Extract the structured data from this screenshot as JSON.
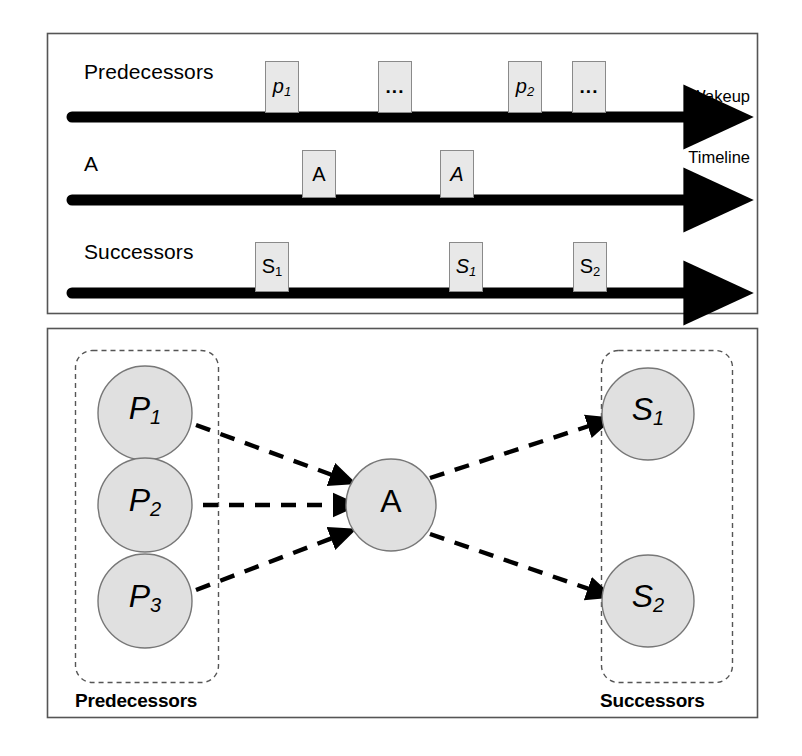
{
  "figure": {
    "title_text": "",
    "background": "#ffffff",
    "node_fill": "#e0e0e0",
    "node_stroke": "#777777",
    "box_fill": "#e8e8e8",
    "box_stroke": "#8a8a8a",
    "line_color": "#000000",
    "panel_stroke": "#555555",
    "dashed_stroke": "#555555"
  },
  "timeline_panel": {
    "axis_note": {
      "line1": "Wakeup",
      "line2": "Timeline"
    },
    "rows": [
      {
        "label": "Predecessors",
        "events": [
          {
            "text": "p",
            "sub": "1",
            "kind": "italic"
          },
          {
            "text": "...",
            "sub": "",
            "kind": "dots"
          },
          {
            "text": "p",
            "sub": "2",
            "kind": "italic"
          },
          {
            "text": "...",
            "sub": "",
            "kind": "dots"
          }
        ]
      },
      {
        "label": "A",
        "events": [
          {
            "text": "A",
            "sub": "",
            "kind": "upright"
          },
          {
            "text": "A",
            "sub": "",
            "kind": "italic"
          }
        ]
      },
      {
        "label": "Successors",
        "events": [
          {
            "text": "S",
            "sub": "1",
            "kind": "upright"
          },
          {
            "text": "S",
            "sub": "1",
            "kind": "italic"
          },
          {
            "text": "S",
            "sub": "2",
            "kind": "upright"
          }
        ]
      }
    ]
  },
  "graph_panel": {
    "groups": [
      {
        "caption": "Predecessors"
      },
      {
        "caption": "Successors"
      }
    ],
    "nodes": [
      {
        "id": "P1",
        "letter": "P",
        "sub": "1"
      },
      {
        "id": "P2",
        "letter": "P",
        "sub": "2"
      },
      {
        "id": "P3",
        "letter": "P",
        "sub": "3"
      },
      {
        "id": "A",
        "letter": "A",
        "sub": ""
      },
      {
        "id": "S1",
        "letter": "S",
        "sub": "1"
      },
      {
        "id": "S2",
        "letter": "S",
        "sub": "2"
      }
    ],
    "edges": [
      {
        "from": "P1",
        "to": "A",
        "style": "dashed-arrow"
      },
      {
        "from": "P2",
        "to": "A",
        "style": "dashed-arrow"
      },
      {
        "from": "P3",
        "to": "A",
        "style": "dashed-arrow"
      },
      {
        "from": "A",
        "to": "S1",
        "style": "dashed-arrow"
      },
      {
        "from": "A",
        "to": "S2",
        "style": "dashed-arrow"
      }
    ]
  }
}
